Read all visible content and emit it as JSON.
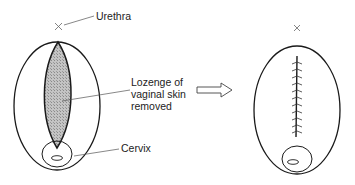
{
  "labels": {
    "urethra": "Urethra",
    "lozenge_line1": "Lozenge of",
    "lozenge_line2": "vaginal skin",
    "lozenge_line3": "removed",
    "cervix": "Cervix"
  },
  "colors": {
    "stroke": "#1a1a1a",
    "shading": "#b8b8b8",
    "leader": "#555555"
  },
  "figure": {
    "left_panel": "before excision",
    "right_panel": "after closure with sutures",
    "suture_count": 11
  }
}
